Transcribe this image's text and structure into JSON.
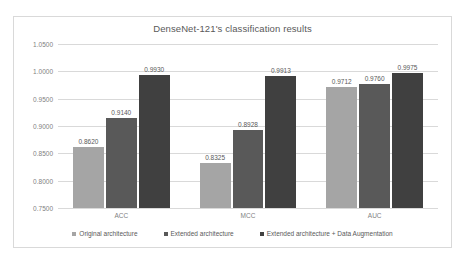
{
  "chart_data": {
    "type": "bar",
    "title": "DenseNet-121's classification results",
    "xlabel": "",
    "ylabel": "",
    "categories": [
      "ACC",
      "MCC",
      "AUC"
    ],
    "ylim": [
      0.75,
      1.05
    ],
    "ytick_step": 0.05,
    "ytick_labels": [
      "1.0500",
      "1.0000",
      "0.9500",
      "0.9000",
      "0.8500",
      "0.8000",
      "0.7500"
    ],
    "ytick_values": [
      1.05,
      1.0,
      0.95,
      0.9,
      0.85,
      0.8,
      0.75
    ],
    "grid": true,
    "legend_position": "bottom",
    "series": [
      {
        "name": "Original architecture",
        "color": "#a5a5a5",
        "values": [
          0.862,
          0.8325,
          0.9712
        ],
        "labels": [
          "0.8620",
          "0.8325",
          "0.9712"
        ]
      },
      {
        "name": "Extended architecture",
        "color": "#595959",
        "values": [
          0.914,
          0.8928,
          0.976
        ],
        "labels": [
          "0.9140",
          "0.8928",
          "0.9760"
        ]
      },
      {
        "name": "Extended architecture + Data Augmentation",
        "color": "#404040",
        "values": [
          0.993,
          0.9913,
          0.9975
        ],
        "labels": [
          "0.9930",
          "0.9913",
          "0.9975"
        ]
      }
    ]
  }
}
